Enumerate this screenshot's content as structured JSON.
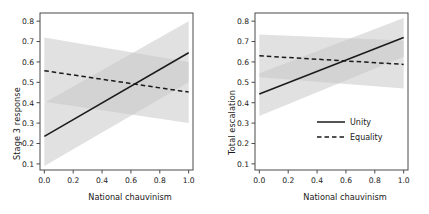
{
  "figure": {
    "background": "#ffffff",
    "line_color": "#1a1a1a",
    "band_color": "#c9c9c9",
    "frame_color": "#4a4a4a"
  },
  "panels": [
    {
      "id": "left",
      "ylabel": "Stage 3 response",
      "xlabel": "National chauvinism",
      "show_legend": false
    },
    {
      "id": "right",
      "ylabel": "Total escalation",
      "xlabel": "National chauvinism",
      "show_legend": true
    }
  ],
  "legend": {
    "items": [
      {
        "label": "Unity",
        "style": "solid"
      },
      {
        "label": "Equality",
        "style": "dashed"
      }
    ]
  },
  "chart_data": [
    {
      "type": "line",
      "panel": "left",
      "title": "",
      "xlabel": "National chauvinism",
      "ylabel": "Stage 3 response",
      "xlim": [
        -0.03,
        1.03
      ],
      "ylim": [
        0.07,
        0.84
      ],
      "xticks": [
        "0.0",
        "0.2",
        "0.4",
        "0.6",
        "0.8",
        "1.0"
      ],
      "xtickvalues": [
        0.0,
        0.2,
        0.4,
        0.6,
        0.8,
        1.0
      ],
      "yticks": [
        "0.1",
        "0.2",
        "0.3",
        "0.4",
        "0.5",
        "0.6",
        "0.7",
        "0.8"
      ],
      "ytickvalues": [
        0.1,
        0.2,
        0.3,
        0.4,
        0.5,
        0.6,
        0.7,
        0.8
      ],
      "grid": false,
      "legend_position": "none",
      "series": [
        {
          "name": "Unity",
          "style": "solid",
          "x": [
            0.0,
            1.0
          ],
          "values": [
            0.235,
            0.645
          ],
          "ci_lower": [
            0.09,
            0.5
          ],
          "ci_upper": [
            0.4,
            0.8
          ]
        },
        {
          "name": "Equality",
          "style": "dashed",
          "x": [
            0.0,
            1.0
          ],
          "values": [
            0.557,
            0.452
          ],
          "ci_lower": [
            0.405,
            0.3
          ],
          "ci_upper": [
            0.72,
            0.6
          ]
        }
      ],
      "crossing_point": {
        "x": 0.6,
        "y": 0.49
      }
    },
    {
      "type": "line",
      "panel": "right",
      "title": "",
      "xlabel": "National chauvinism",
      "ylabel": "Total escalation",
      "xlim": [
        -0.03,
        1.03
      ],
      "ylim": [
        0.07,
        0.84
      ],
      "xticks": [
        "0.0",
        "0.2",
        "0.4",
        "0.6",
        "0.8",
        "1.0"
      ],
      "xtickvalues": [
        0.0,
        0.2,
        0.4,
        0.6,
        0.8,
        1.0
      ],
      "yticks": [
        "0.1",
        "0.2",
        "0.3",
        "0.4",
        "0.5",
        "0.6",
        "0.7",
        "0.8"
      ],
      "ytickvalues": [
        0.1,
        0.2,
        0.3,
        0.4,
        0.5,
        0.6,
        0.7,
        0.8
      ],
      "grid": false,
      "legend_position": "lower right",
      "series": [
        {
          "name": "Unity",
          "style": "solid",
          "x": [
            0.0,
            1.0
          ],
          "values": [
            0.443,
            0.72
          ],
          "ci_lower": [
            0.335,
            0.625
          ],
          "ci_upper": [
            0.545,
            0.815
          ]
        },
        {
          "name": "Equality",
          "style": "dashed",
          "x": [
            0.0,
            1.0
          ],
          "values": [
            0.63,
            0.588
          ],
          "ci_lower": [
            0.525,
            0.47
          ],
          "ci_upper": [
            0.735,
            0.705
          ]
        }
      ],
      "crossing_point": {
        "x": 0.58,
        "y": 0.605
      }
    }
  ]
}
